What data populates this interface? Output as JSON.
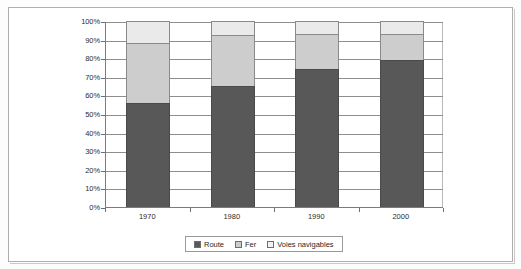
{
  "chart_data": {
    "type": "bar",
    "subtype": "stacked-100-percent",
    "title": "",
    "xlabel": "",
    "ylabel": "",
    "categories": [
      "1970",
      "1980",
      "1990",
      "2000"
    ],
    "series": [
      {
        "name": "Route",
        "color": "#585858",
        "values": [
          56,
          65,
          74,
          79
        ]
      },
      {
        "name": "Fer",
        "color": "#cdcdcd",
        "values": [
          32,
          27.5,
          19,
          14
        ]
      },
      {
        "name": "Voies navigables",
        "color": "#eaeaea",
        "values": [
          12,
          7.5,
          7,
          7
        ]
      }
    ],
    "ylim": [
      0,
      100
    ],
    "yticks": [
      "0%",
      "10%",
      "20%",
      "30%",
      "40%",
      "50%",
      "60%",
      "70%",
      "80%",
      "90%",
      "100%"
    ],
    "ytick_values": [
      0,
      10,
      20,
      30,
      40,
      50,
      60,
      70,
      80,
      90,
      100
    ],
    "grid": true,
    "legend_position": "bottom"
  },
  "legend": {
    "items": [
      {
        "label": "Route",
        "swatch": "route"
      },
      {
        "label": "Fer",
        "swatch": "fer"
      },
      {
        "label": "Voies navigables",
        "swatch": "voies"
      }
    ]
  },
  "colors": {
    "route": "#585858",
    "fer": "#cdcdcd",
    "voies": "#eaeaea",
    "axis": "#7b7b7b",
    "grid": "#8e8e8e",
    "frame": "#aeaeae",
    "background": "#ffffff"
  }
}
